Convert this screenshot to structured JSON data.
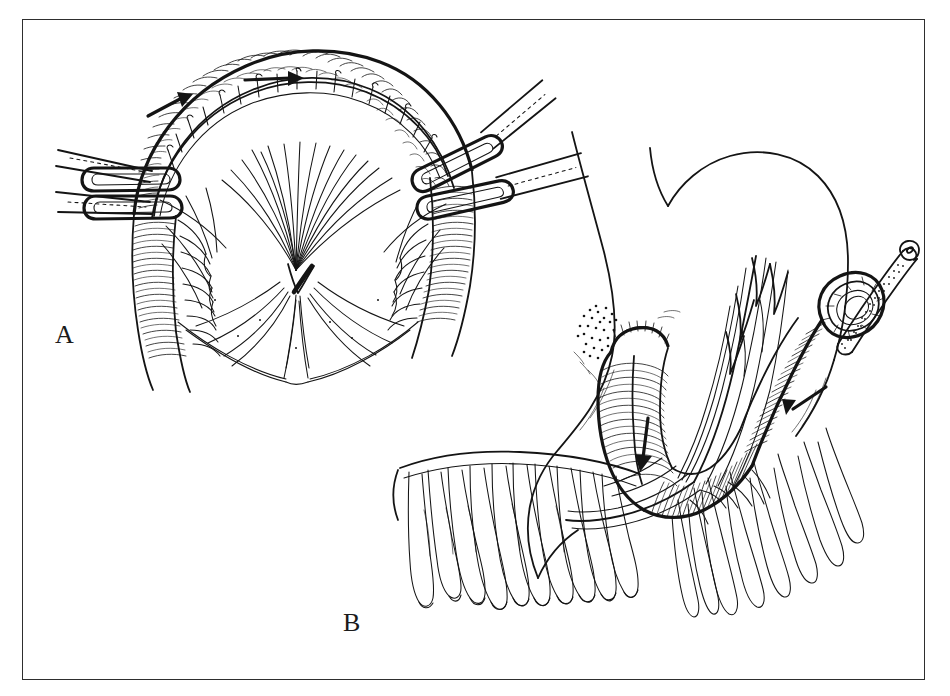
{
  "figure": {
    "kind": "surgical-line-illustration",
    "background_color": "#ffffff",
    "ink_color": "#141414",
    "frame": {
      "present": true,
      "color": "#2e2e2e",
      "x": 22,
      "y": 19,
      "width": 903,
      "height": 661
    },
    "panels": [
      {
        "id": "A",
        "label": "A",
        "label_x": 55,
        "label_y": 322,
        "title": "Bowel segment isolated on its mesenteric vascular pedicle between paired occluding clamps",
        "contents": [
          "arched bowel loop with circular muscle striations",
          "divided mesentery with fan of radiating vessels",
          "marginal vessel arcade along the antimesenteric edge",
          "two parallel clamps on the left limb",
          "two angled clamps on the right limb",
          "directional arrow along the superior bowel wall",
          "directional arrow along the left superior bowel wall"
        ],
        "arrows": [
          {
            "name": "peristalsis-arrow-upper",
            "x1": 245,
            "y1": 80,
            "x2": 296,
            "y2": 78,
            "direction": "right"
          },
          {
            "name": "peristalsis-arrow-left",
            "x1": 148,
            "y1": 116,
            "x2": 186,
            "y2": 96,
            "direction": "up-right"
          }
        ],
        "clamps": [
          {
            "name": "clamp-left-upper",
            "x": 95,
            "y": 167,
            "angle": -4
          },
          {
            "name": "clamp-left-lower",
            "x": 95,
            "y": 193,
            "angle": -3
          },
          {
            "name": "clamp-right-upper",
            "x": 418,
            "y": 170,
            "angle": -28
          },
          {
            "name": "clamp-right-lower",
            "x": 430,
            "y": 196,
            "angle": -14
          }
        ]
      },
      {
        "id": "B",
        "label": "B",
        "label_x": 343,
        "label_y": 610,
        "title": "Colon interposition conduit brought up beside the stomach with greater omentum and indwelling catheter",
        "contents": [
          "stomach outline with greater curvature",
          "greater omentum with pendulous fatty fringes",
          "interposed colon conduit with haustral markings",
          "closed and sutured proximal conduit end with stippled shading",
          "catheter / feeding tube entering the open distal limb",
          "mesenteric pedicle carrying the conduit",
          "directional arrow within the proximal conduit limb",
          "directional arrow within the distal conduit limb"
        ],
        "arrows": [
          {
            "name": "conduit-arrow-proximal",
            "x1": 648,
            "y1": 418,
            "x2": 641,
            "y2": 470,
            "direction": "down"
          },
          {
            "name": "conduit-arrow-distal",
            "x1": 826,
            "y1": 387,
            "x2": 786,
            "y2": 414,
            "direction": "down-left"
          }
        ],
        "catheter": {
          "name": "catheter-tube",
          "tip_x": 907,
          "tip_y": 252,
          "entry_x": 835,
          "entry_y": 345
        }
      }
    ]
  }
}
